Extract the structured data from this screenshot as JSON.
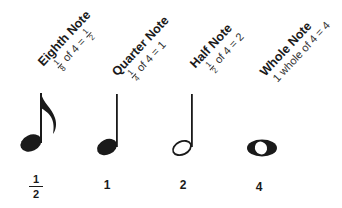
{
  "diagram": {
    "notes": [
      {
        "name": "Eighth Note",
        "formula": {
          "frac_num": "1",
          "frac_den": "8",
          "middle": "of 4 =",
          "result_num": "1",
          "result_den": "2"
        },
        "beats": {
          "num": "1",
          "den": "2"
        }
      },
      {
        "name": "Quarter Note",
        "formula": {
          "frac_num": "1",
          "frac_den": "4",
          "middle": "of 4 = 1"
        },
        "beats": "1"
      },
      {
        "name": "Half Note",
        "formula": {
          "frac_num": "1",
          "frac_den": "2",
          "middle": "of 4 = 2"
        },
        "beats": "2"
      },
      {
        "name": "Whole Note",
        "formula": {
          "text": "1 whole of 4 = 4"
        },
        "beats": "4"
      }
    ],
    "colors": {
      "ink": "#1a1a1a",
      "background": "#ffffff"
    }
  }
}
